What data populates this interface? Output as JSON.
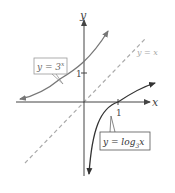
{
  "diagram": {
    "title": "",
    "axes": {
      "x_label": "x",
      "y_label": "y",
      "x_tick_label": "1",
      "y_tick_label": "1"
    },
    "curves": [
      {
        "name": "exponential",
        "label": "y = 3",
        "superscript": "x",
        "color": "#6b6b6b"
      },
      {
        "name": "logarithmic",
        "label_prefix": "y = log",
        "subscript": "3",
        "label_suffix": "x",
        "color": "#3a3a3a"
      }
    ],
    "reference_line": {
      "label": "y = x",
      "color": "#a8a8a8",
      "style": "dashed"
    },
    "colors": {
      "axis": "#555555",
      "exp_curve": "#777777",
      "log_curve": "#3a3a3a",
      "dashed": "#aaaaaa",
      "label_box_border": "#999999"
    }
  }
}
